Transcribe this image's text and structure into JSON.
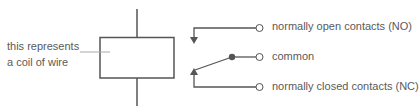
{
  "diagram": {
    "type": "relay-schematic",
    "coil_label": [
      "this represents",
      "a coil of wire"
    ],
    "contacts": [
      {
        "id": "NO",
        "label": "normally open contacts (NO)"
      },
      {
        "id": "COM",
        "label": "common"
      },
      {
        "id": "NC",
        "label": "normally closed contacts (NC)"
      }
    ],
    "colors": {
      "line": "#555555",
      "text": "#5a5a5a",
      "callout": "#aaaaaa"
    }
  }
}
